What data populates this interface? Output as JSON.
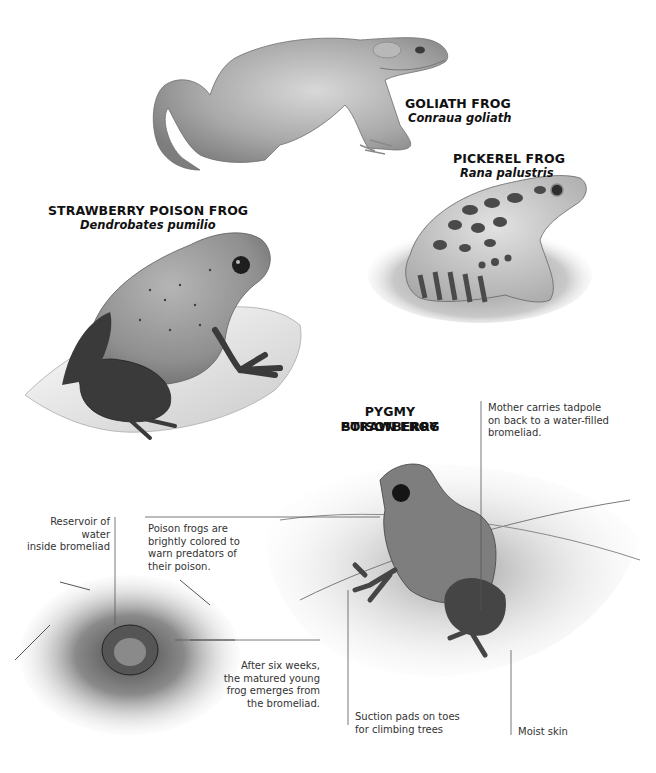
{
  "figure": {
    "frogs": [
      {
        "id": "goliath",
        "common_name": "GOLIATH FROG",
        "scientific_name": "Conraua goliath"
      },
      {
        "id": "pickerel",
        "common_name": "PICKEREL FROG",
        "scientific_name": "Rana palustris"
      },
      {
        "id": "strawberry",
        "common_name": "STRAWBERRY POISON FROG",
        "scientific_name": "Dendrobates pumilio"
      },
      {
        "id": "pygmy",
        "common_name_line1": "PYGMY STRAWBERRY",
        "common_name_line2": "POISON FROG"
      }
    ],
    "callouts": {
      "mother": "Mother carries tadpole\non back to a water-filled\nbromeliad.",
      "reservoir": "Reservoir of water\ninside bromeliad",
      "poison": "Poison frogs are\nbrightly colored to\nwarn predators of\ntheir poison.",
      "six_weeks": "After six weeks,\nthe matured young\nfrog emerges from\nthe bromeliad.",
      "suction": "Suction pads on toes\nfor climbing trees",
      "moist": "Moist skin"
    },
    "colors": {
      "background": "#ffffff",
      "ink": "#111111",
      "caption": "#333333",
      "leader_line": "#555555"
    }
  }
}
